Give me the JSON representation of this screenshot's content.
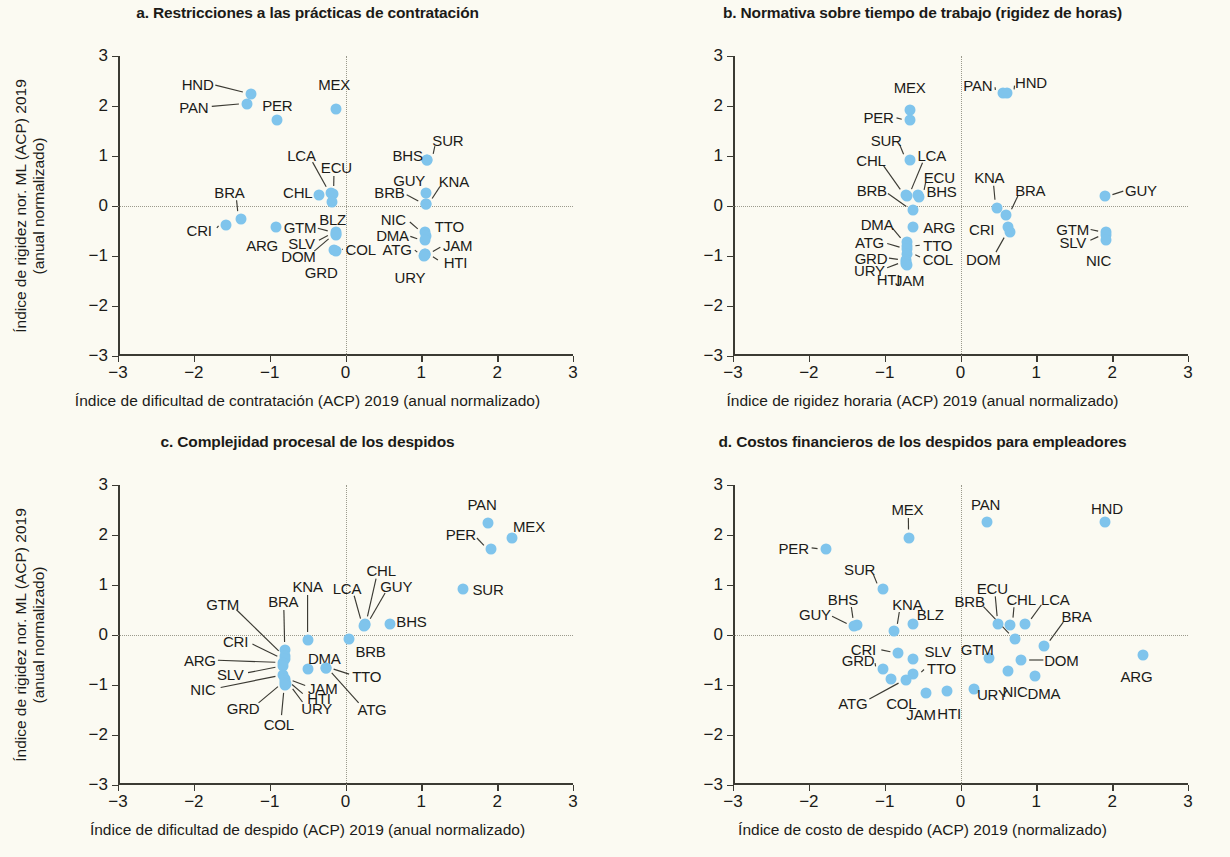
{
  "figure": {
    "background": "#fbfaf2",
    "dot_color": "#7fc4ec",
    "axis_color": "#3b3a33",
    "guide_color": "#9b9a8d"
  },
  "shared": {
    "y_axis_title_line1": "Índice de rigidez nor. ML (ACP) 2019",
    "y_axis_title_line2": "(anual normalizado)",
    "ticks": [
      "-3",
      "-2",
      "-1",
      "0",
      "1",
      "2",
      "3"
    ],
    "tick_values": [
      -3,
      -2,
      -1,
      0,
      1,
      2,
      3
    ]
  },
  "chart_data": [
    {
      "id": "a",
      "type": "scatter",
      "title": "a. Restricciones a las prácticas de contratación",
      "xlabel": "Índice de dificultad de contratación (ACP) 2019 (anual normalizado)",
      "ylabel": "Índice de rigidez nor. ML (ACP) 2019 (anual normalizado)",
      "xlim": [
        -3,
        3
      ],
      "ylim": [
        -3,
        3
      ],
      "xticks": [
        -3,
        -2,
        -1,
        0,
        1,
        2,
        3
      ],
      "yticks": [
        -3,
        -2,
        -1,
        0,
        1,
        2,
        3
      ],
      "grid": false,
      "zero_lines": true,
      "legend": "none",
      "points": [
        {
          "label": "HND",
          "x": -1.25,
          "y": 2.25,
          "lx": -1.95,
          "ly": 2.45
        },
        {
          "label": "PAN",
          "x": -1.3,
          "y": 2.05,
          "lx": -2.0,
          "ly": 1.98
        },
        {
          "label": "PER",
          "x": -0.9,
          "y": 1.72,
          "lx": -0.9,
          "ly": 2.02
        },
        {
          "label": "MEX",
          "x": -0.13,
          "y": 1.95,
          "lx": -0.15,
          "ly": 2.45
        },
        {
          "label": "SUR",
          "x": 1.08,
          "y": 0.93,
          "lx": 1.35,
          "ly": 1.32
        },
        {
          "label": "BHS",
          "x": 1.08,
          "y": 0.93,
          "lx": 0.82,
          "ly": 1.02
        },
        {
          "label": "GUY",
          "x": 1.06,
          "y": 0.27,
          "lx": 0.84,
          "ly": 0.53
        },
        {
          "label": "KNA",
          "x": 1.06,
          "y": 0.05,
          "lx": 1.43,
          "ly": 0.5
        },
        {
          "label": "BRB",
          "x": 1.06,
          "y": 0.05,
          "lx": 0.58,
          "ly": 0.28
        },
        {
          "label": "LCA",
          "x": -0.19,
          "y": 0.26,
          "lx": -0.58,
          "ly": 1.02
        },
        {
          "label": "ECU",
          "x": -0.17,
          "y": 0.24,
          "lx": -0.12,
          "ly": 0.78
        },
        {
          "label": "CHL",
          "x": -0.35,
          "y": 0.22,
          "lx": -0.63,
          "ly": 0.28
        },
        {
          "label": "BLZ",
          "x": -0.18,
          "y": 0.09,
          "lx": -0.17,
          "ly": -0.25
        },
        {
          "label": "BRA",
          "x": -1.38,
          "y": -0.25,
          "lx": -1.53,
          "ly": 0.28
        },
        {
          "label": "CRI",
          "x": -1.57,
          "y": -0.37,
          "lx": -1.93,
          "ly": -0.47
        },
        {
          "label": "ARG",
          "x": -0.92,
          "y": -0.42,
          "lx": -1.1,
          "ly": -0.78
        },
        {
          "label": "GTM",
          "x": -0.13,
          "y": -0.52,
          "lx": -0.6,
          "ly": -0.42
        },
        {
          "label": "SLV",
          "x": -0.13,
          "y": -0.55,
          "lx": -0.58,
          "ly": -0.73
        },
        {
          "label": "DOM",
          "x": -0.13,
          "y": -0.58,
          "lx": -0.62,
          "ly": -0.99
        },
        {
          "label": "NIC",
          "x": 1.05,
          "y": -0.52,
          "lx": 0.63,
          "ly": -0.25
        },
        {
          "label": "TTO",
          "x": 1.06,
          "y": -0.6,
          "lx": 1.37,
          "ly": -0.4
        },
        {
          "label": "DMA",
          "x": 1.05,
          "y": -0.68,
          "lx": 0.62,
          "ly": -0.58
        },
        {
          "label": "COL",
          "x": -0.15,
          "y": -0.88,
          "lx": 0.2,
          "ly": -0.85
        },
        {
          "label": "GRD",
          "x": -0.13,
          "y": -0.9,
          "lx": -0.32,
          "ly": -1.32
        },
        {
          "label": "ATG",
          "x": 1.05,
          "y": -0.95,
          "lx": 0.68,
          "ly": -0.85
        },
        {
          "label": "JAM",
          "x": 1.05,
          "y": -0.95,
          "lx": 1.48,
          "ly": -0.78
        },
        {
          "label": "HTI",
          "x": 1.05,
          "y": -0.98,
          "lx": 1.45,
          "ly": -1.12
        },
        {
          "label": "URY",
          "x": 1.03,
          "y": -1.0,
          "lx": 0.85,
          "ly": -1.42
        }
      ]
    },
    {
      "id": "b",
      "type": "scatter",
      "title": "b. Normativa sobre tiempo de trabajo (rigidez de horas)",
      "xlabel": "Índice de rigidez horaria (ACP) 2019 (anual normalizado)",
      "ylabel": "Índice de rigidez nor. ML (ACP) 2019 (anual normalizado)",
      "xlim": [
        -3,
        3
      ],
      "ylim": [
        -3,
        3
      ],
      "xticks": [
        -3,
        -2,
        -1,
        0,
        1,
        2,
        3
      ],
      "yticks": [
        -3,
        -2,
        -1,
        0,
        1,
        2,
        3
      ],
      "grid": false,
      "zero_lines": true,
      "legend": "none",
      "points": [
        {
          "label": "PAN",
          "x": 0.56,
          "y": 2.27,
          "lx": 0.23,
          "ly": 2.43
        },
        {
          "label": "HND",
          "x": 0.61,
          "y": 2.27,
          "lx": 0.93,
          "ly": 2.48
        },
        {
          "label": "MEX",
          "x": -0.67,
          "y": 1.93,
          "lx": -0.67,
          "ly": 2.38
        },
        {
          "label": "PER",
          "x": -0.67,
          "y": 1.72,
          "lx": -1.08,
          "ly": 1.78
        },
        {
          "label": "SUR",
          "x": -0.67,
          "y": 0.93,
          "lx": -0.98,
          "ly": 1.33
        },
        {
          "label": "LCA",
          "x": -0.7,
          "y": 0.2,
          "lx": -0.38,
          "ly": 1.02
        },
        {
          "label": "CHL",
          "x": -0.72,
          "y": 0.22,
          "lx": -1.18,
          "ly": 0.93
        },
        {
          "label": "ECU",
          "x": -0.56,
          "y": 0.22,
          "lx": -0.28,
          "ly": 0.58
        },
        {
          "label": "BHS",
          "x": -0.55,
          "y": 0.18,
          "lx": -0.25,
          "ly": 0.3
        },
        {
          "label": "BRB",
          "x": -0.62,
          "y": -0.08,
          "lx": -1.17,
          "ly": 0.33
        },
        {
          "label": "KNA",
          "x": 0.48,
          "y": -0.03,
          "lx": 0.38,
          "ly": 0.58
        },
        {
          "label": "BRA",
          "x": 0.6,
          "y": -0.18,
          "lx": 0.92,
          "ly": 0.33
        },
        {
          "label": "GUY",
          "x": 1.9,
          "y": 0.2,
          "lx": 2.38,
          "ly": 0.33
        },
        {
          "label": "CRI",
          "x": 0.62,
          "y": -0.42,
          "lx": 0.28,
          "ly": -0.45
        },
        {
          "label": "DOM",
          "x": 0.65,
          "y": -0.52,
          "lx": 0.3,
          "ly": -1.05
        },
        {
          "label": "ARG",
          "x": -0.62,
          "y": -0.42,
          "lx": -0.28,
          "ly": -0.42
        },
        {
          "label": "DMA",
          "x": -0.7,
          "y": -0.72,
          "lx": -1.1,
          "ly": -0.35
        },
        {
          "label": "TTO",
          "x": -0.7,
          "y": -0.8,
          "lx": -0.3,
          "ly": -0.78
        },
        {
          "label": "ATG",
          "x": -0.7,
          "y": -0.85,
          "lx": -1.2,
          "ly": -0.72
        },
        {
          "label": "COL",
          "x": -0.7,
          "y": -0.95,
          "lx": -0.3,
          "ly": -1.05
        },
        {
          "label": "GRD",
          "x": -0.72,
          "y": -1.08,
          "lx": -1.18,
          "ly": -1.03
        },
        {
          "label": "URY",
          "x": -0.72,
          "y": -1.12,
          "lx": -1.2,
          "ly": -1.27
        },
        {
          "label": "HTI",
          "x": -0.72,
          "y": -1.15,
          "lx": -0.95,
          "ly": -1.45
        },
        {
          "label": "JAM",
          "x": -0.7,
          "y": -1.18,
          "lx": -0.67,
          "ly": -1.48
        },
        {
          "label": "GTM",
          "x": 1.92,
          "y": -0.52,
          "lx": 1.48,
          "ly": -0.45
        },
        {
          "label": "SLV",
          "x": 1.92,
          "y": -0.58,
          "lx": 1.48,
          "ly": -0.72
        },
        {
          "label": "NIC",
          "x": 1.92,
          "y": -0.68,
          "lx": 1.82,
          "ly": -1.08
        }
      ]
    },
    {
      "id": "c",
      "type": "scatter",
      "title": "c. Complejidad procesal de los despidos",
      "xlabel": "Índice de dificultad de despido (ACP) 2019 (anual normalizado)",
      "ylabel": "Índice de rigidez nor. ML (ACP) 2019 (anual normalizado)",
      "xlim": [
        -3,
        3
      ],
      "ylim": [
        -3,
        3
      ],
      "xticks": [
        -3,
        -2,
        -1,
        0,
        1,
        2,
        3
      ],
      "yticks": [
        -3,
        -2,
        -1,
        0,
        1,
        2,
        3
      ],
      "grid": false,
      "zero_lines": true,
      "legend": "none",
      "points": [
        {
          "label": "PAN",
          "x": 1.88,
          "y": 2.25,
          "lx": 1.8,
          "ly": 2.62
        },
        {
          "label": "MEX",
          "x": 2.2,
          "y": 1.95,
          "lx": 2.42,
          "ly": 2.18
        },
        {
          "label": "PER",
          "x": 1.92,
          "y": 1.72,
          "lx": 1.52,
          "ly": 2.02
        },
        {
          "label": "SUR",
          "x": 1.55,
          "y": 0.93,
          "lx": 1.88,
          "ly": 0.93
        },
        {
          "label": "CHL",
          "x": 0.26,
          "y": 0.22,
          "lx": 0.47,
          "ly": 1.3
        },
        {
          "label": "GUY",
          "x": 0.26,
          "y": 0.2,
          "lx": 0.67,
          "ly": 0.98
        },
        {
          "label": "LCA",
          "x": 0.24,
          "y": 0.18,
          "lx": 0.02,
          "ly": 0.95
        },
        {
          "label": "BHS",
          "x": 0.59,
          "y": 0.22,
          "lx": 0.87,
          "ly": 0.28
        },
        {
          "label": "KNA",
          "x": -0.5,
          "y": -0.1,
          "lx": -0.5,
          "ly": 0.98
        },
        {
          "label": "BRB",
          "x": 0.05,
          "y": -0.08,
          "lx": 0.33,
          "ly": -0.32
        },
        {
          "label": "BRA",
          "x": -0.8,
          "y": -0.3,
          "lx": -0.82,
          "ly": 0.68
        },
        {
          "label": "GTM",
          "x": -0.8,
          "y": -0.42,
          "lx": -1.62,
          "ly": 0.62
        },
        {
          "label": "CRI",
          "x": -0.8,
          "y": -0.48,
          "lx": -1.45,
          "ly": -0.12
        },
        {
          "label": "ARG",
          "x": -0.82,
          "y": -0.55,
          "lx": -1.92,
          "ly": -0.5
        },
        {
          "label": "SLV",
          "x": -0.82,
          "y": -0.62,
          "lx": -1.52,
          "ly": -0.78
        },
        {
          "label": "DMA",
          "x": -0.5,
          "y": -0.68,
          "lx": -0.28,
          "ly": -0.45
        },
        {
          "label": "TTO",
          "x": -0.26,
          "y": -0.65,
          "lx": 0.28,
          "ly": -0.82
        },
        {
          "label": "NIC",
          "x": -0.82,
          "y": -0.8,
          "lx": -1.88,
          "ly": -1.08
        },
        {
          "label": "JAM",
          "x": -0.8,
          "y": -0.88,
          "lx": -0.3,
          "ly": -1.05
        },
        {
          "label": "HTI",
          "x": -0.8,
          "y": -0.92,
          "lx": -0.35,
          "ly": -1.25
        },
        {
          "label": "GRD",
          "x": -0.8,
          "y": -0.95,
          "lx": -1.35,
          "ly": -1.45
        },
        {
          "label": "URY",
          "x": -0.78,
          "y": -0.98,
          "lx": -0.38,
          "ly": -1.45
        },
        {
          "label": "COL",
          "x": -0.8,
          "y": -1.0,
          "lx": -0.88,
          "ly": -1.78
        },
        {
          "label": "ATG",
          "x": -0.26,
          "y": -0.65,
          "lx": 0.35,
          "ly": -1.48
        }
      ]
    },
    {
      "id": "d",
      "type": "scatter",
      "title": "d. Costos financieros de los despidos para empleadores",
      "xlabel": "Índice de costo de despido (ACP) 2019 (normalizado)",
      "ylabel": "Índice de rigidez nor. ML (ACP) 2019 (anual normalizado)",
      "xlim": [
        -3,
        3
      ],
      "ylim": [
        -3,
        3
      ],
      "xticks": [
        -3,
        -2,
        -1,
        0,
        1,
        2,
        3
      ],
      "yticks": [
        -3,
        -2,
        -1,
        0,
        1,
        2,
        3
      ],
      "grid": false,
      "zero_lines": true,
      "legend": "none",
      "points": [
        {
          "label": "PAN",
          "x": 0.35,
          "y": 2.27,
          "lx": 0.33,
          "ly": 2.62
        },
        {
          "label": "HND",
          "x": 1.9,
          "y": 2.27,
          "lx": 1.93,
          "ly": 2.55
        },
        {
          "label": "MEX",
          "x": -0.68,
          "y": 1.95,
          "lx": -0.7,
          "ly": 2.52
        },
        {
          "label": "PER",
          "x": -1.78,
          "y": 1.72,
          "lx": -2.2,
          "ly": 1.75
        },
        {
          "label": "SUR",
          "x": -1.02,
          "y": 0.93,
          "lx": -1.33,
          "ly": 1.32
        },
        {
          "label": "BHS",
          "x": -1.37,
          "y": 0.2,
          "lx": -1.55,
          "ly": 0.72
        },
        {
          "label": "GUY",
          "x": -1.4,
          "y": 0.18,
          "lx": -1.92,
          "ly": 0.43
        },
        {
          "label": "KNA",
          "x": -0.88,
          "y": 0.08,
          "lx": -0.7,
          "ly": 0.62
        },
        {
          "label": "BLZ",
          "x": -0.62,
          "y": 0.22,
          "lx": -0.4,
          "ly": 0.43
        },
        {
          "label": "ECU",
          "x": 0.5,
          "y": 0.22,
          "lx": 0.42,
          "ly": 0.95
        },
        {
          "label": "CHL",
          "x": 0.65,
          "y": 0.2,
          "lx": 0.8,
          "ly": 0.72
        },
        {
          "label": "LCA",
          "x": 0.85,
          "y": 0.22,
          "lx": 1.25,
          "ly": 0.72
        },
        {
          "label": "BRB",
          "x": 0.72,
          "y": -0.07,
          "lx": 0.12,
          "ly": 0.68
        },
        {
          "label": "BRA",
          "x": 1.1,
          "y": -0.22,
          "lx": 1.53,
          "ly": 0.38
        },
        {
          "label": "CRI",
          "x": -0.82,
          "y": -0.35,
          "lx": -1.28,
          "ly": -0.28
        },
        {
          "label": "SLV",
          "x": -0.62,
          "y": -0.48,
          "lx": -0.3,
          "ly": -0.32
        },
        {
          "label": "GTM",
          "x": 0.38,
          "y": -0.45,
          "lx": 0.22,
          "ly": -0.28
        },
        {
          "label": "DOM",
          "x": 0.8,
          "y": -0.5,
          "lx": 1.33,
          "ly": -0.5
        },
        {
          "label": "ARG",
          "x": 2.4,
          "y": -0.4,
          "lx": 2.32,
          "ly": -0.82
        },
        {
          "label": "GRD",
          "x": -1.02,
          "y": -0.68,
          "lx": -1.35,
          "ly": -0.5
        },
        {
          "label": "TTO",
          "x": -0.62,
          "y": -0.78,
          "lx": -0.25,
          "ly": -0.65
        },
        {
          "label": "NIC",
          "x": 0.62,
          "y": -0.72,
          "lx": 0.72,
          "ly": -1.12
        },
        {
          "label": "DMA",
          "x": 0.98,
          "y": -0.82,
          "lx": 1.1,
          "ly": -1.15
        },
        {
          "label": "COL",
          "x": -0.92,
          "y": -0.88,
          "lx": -0.78,
          "ly": -1.35
        },
        {
          "label": "ATG",
          "x": -0.72,
          "y": -0.9,
          "lx": -1.42,
          "ly": -1.35
        },
        {
          "label": "URY",
          "x": 0.18,
          "y": -1.08,
          "lx": 0.42,
          "ly": -1.18
        },
        {
          "label": "JAM",
          "x": -0.45,
          "y": -1.15,
          "lx": -0.52,
          "ly": -1.58
        },
        {
          "label": "HTI",
          "x": -0.18,
          "y": -1.12,
          "lx": -0.15,
          "ly": -1.55
        }
      ]
    }
  ]
}
